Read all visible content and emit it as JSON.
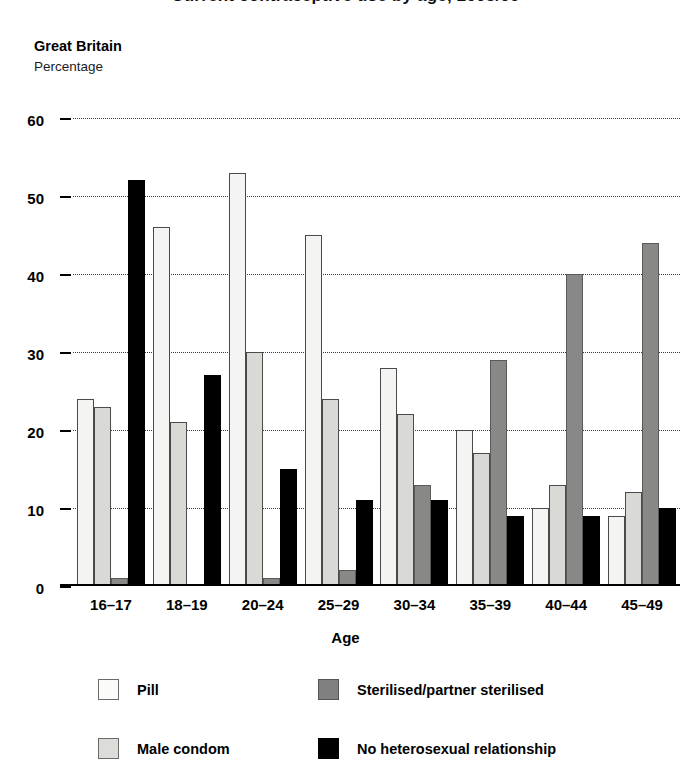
{
  "chart_title": "Current contraceptive use by age, 2008/09",
  "region_label": "Great Britain",
  "units_label": "Percentage",
  "axis": {
    "x_title": "Age",
    "y_ticks": [
      "0",
      "10",
      "20",
      "30",
      "40",
      "50",
      "60"
    ]
  },
  "legend": {
    "items": [
      {
        "key": "pill",
        "label": "Pill",
        "color": "#f4f4f2"
      },
      {
        "key": "sterilised",
        "label": "Sterilised/partner sterilised",
        "color": "#888886"
      },
      {
        "key": "condom",
        "label": "Male condom",
        "color": "#d9d9d6"
      },
      {
        "key": "none",
        "label": "No heterosexual relationship",
        "color": "#000000"
      }
    ]
  },
  "chart_data": {
    "type": "bar",
    "title": "Current contraceptive use by age, 2008/09",
    "subtitle": "Great Britain",
    "xlabel": "Age",
    "ylabel": "Percentage",
    "ylim": [
      0,
      60
    ],
    "ytick_values": [
      0,
      10,
      20,
      30,
      40,
      50,
      60
    ],
    "grid": true,
    "legend_position": "bottom",
    "categories": [
      "16–17",
      "18–19",
      "20–24",
      "25–29",
      "30–34",
      "35–39",
      "40–44",
      "45–49"
    ],
    "series": [
      {
        "name": "Pill",
        "color": "#f4f4f2",
        "values": [
          24,
          46,
          53,
          45,
          28,
          20,
          10,
          9
        ]
      },
      {
        "name": "Male condom",
        "color": "#d9d9d6",
        "values": [
          23,
          21,
          30,
          24,
          22,
          17,
          13,
          12
        ]
      },
      {
        "name": "Sterilised/partner sterilised",
        "color": "#888886",
        "values": [
          1,
          0,
          1,
          2,
          13,
          29,
          40,
          44
        ]
      },
      {
        "name": "No heterosexual relationship",
        "color": "#000000",
        "values": [
          52,
          27,
          15,
          11,
          11,
          9,
          9,
          10
        ]
      }
    ]
  }
}
